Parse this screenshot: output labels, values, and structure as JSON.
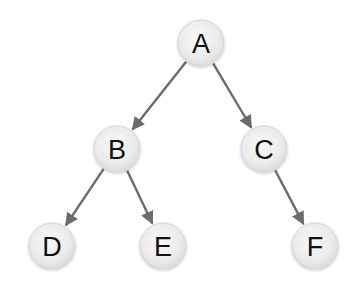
{
  "diagram": {
    "type": "tree",
    "colors": {
      "edge": "#6b6b6b",
      "node_fill": "#ececec",
      "node_stroke": "#d6d6d6",
      "label": "#111111",
      "background": "#ffffff"
    },
    "nodes": [
      {
        "id": "A",
        "label": "A",
        "x": 201,
        "y": 43
      },
      {
        "id": "B",
        "label": "B",
        "x": 117,
        "y": 149
      },
      {
        "id": "C",
        "label": "C",
        "x": 264,
        "y": 149
      },
      {
        "id": "D",
        "label": "D",
        "x": 52,
        "y": 246
      },
      {
        "id": "E",
        "label": "E",
        "x": 163,
        "y": 246
      },
      {
        "id": "F",
        "label": "F",
        "x": 315,
        "y": 246
      }
    ],
    "edges": [
      {
        "from": "A",
        "to": "B"
      },
      {
        "from": "A",
        "to": "C"
      },
      {
        "from": "B",
        "to": "D"
      },
      {
        "from": "B",
        "to": "E"
      },
      {
        "from": "C",
        "to": "F"
      }
    ]
  }
}
